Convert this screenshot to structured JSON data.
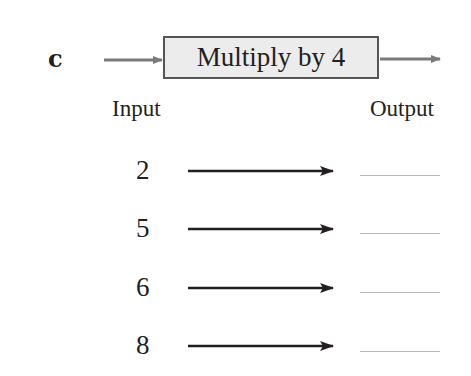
{
  "exercise": {
    "label": "c",
    "machine": {
      "rule": "Multiply by 4",
      "arrow_color": "#7a7a7a",
      "box_fill": "#ececec"
    },
    "headers": {
      "input": "Input",
      "output": "Output"
    },
    "rows": [
      {
        "input": "2",
        "output": ""
      },
      {
        "input": "5",
        "output": ""
      },
      {
        "input": "6",
        "output": ""
      },
      {
        "input": "8",
        "output": ""
      }
    ]
  }
}
